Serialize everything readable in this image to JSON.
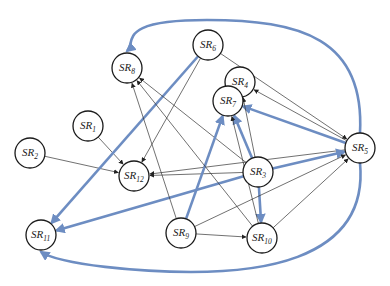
{
  "diagram": {
    "type": "directed-graph",
    "caption_fragment": "",
    "colors": {
      "thin_edge": "#333333",
      "thick_edge": "#6d8dc2",
      "node_stroke": "#1a1a1a",
      "node_fill": "#ffffff"
    },
    "nodes": [
      {
        "id": "SR1",
        "base": "SR",
        "sub": "1",
        "x": 88,
        "y": 126
      },
      {
        "id": "SR2",
        "base": "SR",
        "sub": "2",
        "x": 30,
        "y": 153
      },
      {
        "id": "SR3",
        "base": "SR",
        "sub": "3",
        "x": 258,
        "y": 172
      },
      {
        "id": "SR4",
        "base": "SR",
        "sub": "4",
        "x": 240,
        "y": 82
      },
      {
        "id": "SR5",
        "base": "SR",
        "sub": "5",
        "x": 360,
        "y": 148
      },
      {
        "id": "SR6",
        "base": "SR",
        "sub": "6",
        "x": 208,
        "y": 45
      },
      {
        "id": "SR7",
        "base": "SR",
        "sub": "7",
        "x": 228,
        "y": 101
      },
      {
        "id": "SR8",
        "base": "SR",
        "sub": "8",
        "x": 127,
        "y": 68
      },
      {
        "id": "SR9",
        "base": "SR",
        "sub": "9",
        "x": 181,
        "y": 233
      },
      {
        "id": "SR10",
        "base": "SR",
        "sub": "10",
        "x": 262,
        "y": 238
      },
      {
        "id": "SR11",
        "base": "SR",
        "sub": "11",
        "x": 41,
        "y": 235
      },
      {
        "id": "SR12",
        "base": "SR",
        "sub": "12",
        "x": 134,
        "y": 176
      }
    ],
    "edges": [
      {
        "from": "SR1",
        "to": "SR12",
        "weight": "thin"
      },
      {
        "from": "SR2",
        "to": "SR12",
        "weight": "thin"
      },
      {
        "from": "SR6",
        "to": "SR12",
        "weight": "thin"
      },
      {
        "from": "SR6",
        "to": "SR5",
        "weight": "thin"
      },
      {
        "from": "SR6",
        "to": "SR11",
        "weight": "thick"
      },
      {
        "from": "SR5",
        "to": "SR8",
        "weight": "thick",
        "curved": true
      },
      {
        "from": "SR5",
        "to": "SR4",
        "weight": "thin"
      },
      {
        "from": "SR5",
        "to": "SR7",
        "weight": "thick"
      },
      {
        "from": "SR5",
        "to": "SR12",
        "weight": "thin"
      },
      {
        "from": "SR5",
        "to": "SR11",
        "weight": "thick",
        "curved": true
      },
      {
        "from": "SR3",
        "to": "SR8",
        "weight": "thin"
      },
      {
        "from": "SR3",
        "to": "SR4",
        "weight": "thin"
      },
      {
        "from": "SR3",
        "to": "SR7",
        "weight": "thick"
      },
      {
        "from": "SR3",
        "to": "SR12",
        "weight": "thin"
      },
      {
        "from": "SR3",
        "to": "SR11",
        "weight": "thick"
      },
      {
        "from": "SR3",
        "to": "SR5",
        "weight": "thick"
      },
      {
        "from": "SR3",
        "to": "SR10",
        "weight": "thick"
      },
      {
        "from": "SR9",
        "to": "SR8",
        "weight": "thin"
      },
      {
        "from": "SR9",
        "to": "SR7",
        "weight": "thick"
      },
      {
        "from": "SR9",
        "to": "SR10",
        "weight": "thin"
      },
      {
        "from": "SR9",
        "to": "SR5",
        "weight": "thin"
      },
      {
        "from": "SR10",
        "to": "SR8",
        "weight": "thin"
      },
      {
        "from": "SR10",
        "to": "SR7",
        "weight": "thin"
      },
      {
        "from": "SR10",
        "to": "SR5",
        "weight": "thin"
      }
    ]
  }
}
